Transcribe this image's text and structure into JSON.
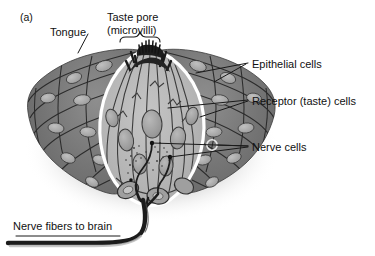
{
  "figure": {
    "panel_letter": "(a)",
    "background_color": "#ffffff",
    "text_color": "#111111",
    "leader_line_color": "#1a1a1a"
  },
  "labels": {
    "tongue": "Tongue",
    "taste_pore_line1": "Taste pore",
    "taste_pore_line2": "(microvilli)",
    "epithelial_cells": "Epithelial cells",
    "receptor_cells": "Receptor (taste) cells",
    "nerve_cells": "Nerve cells",
    "nerve_fibers": "Nerve fibers to brain"
  },
  "colors": {
    "epithelium_dark": "#6f6f6f",
    "epithelium_mid": "#7c7c7c",
    "epithelium_light": "#8c8c8c",
    "epithelial_nucleus": "#ababab",
    "taste_bud_fill": "#b6b6b6",
    "taste_bud_outline": "#ffffff",
    "receptor_cell_fill": "#acacac",
    "receptor_nucleus": "#9a9a9a",
    "cell_outline": "#2b2b2b",
    "nerve_fiber": "#1c1c1c",
    "microvilli": "#1a1a1a",
    "shadow": "#c9c9c9"
  },
  "structures": {
    "taste_bud": "onion-shaped pale gray taste bud outlined in white, embedded in tongue epithelium",
    "taste_pore": "dark spiky microvilli projecting from apex of taste bud at top center",
    "brace": "curly brace bracket spanning the taste pore region",
    "epithelial_tissue": "dark gray flattened squamous epithelial cells with light oval nuclei flanking the taste bud",
    "receptor_cells": "elongated spindle-shaped cells inside the taste bud running apex to base",
    "nerve_cells": "small dark nerve endings with stippled granules among the receptor cells",
    "nerve_fiber_bundle": "thick dark nerve fibers converging at the base and curving down-left off frame"
  }
}
